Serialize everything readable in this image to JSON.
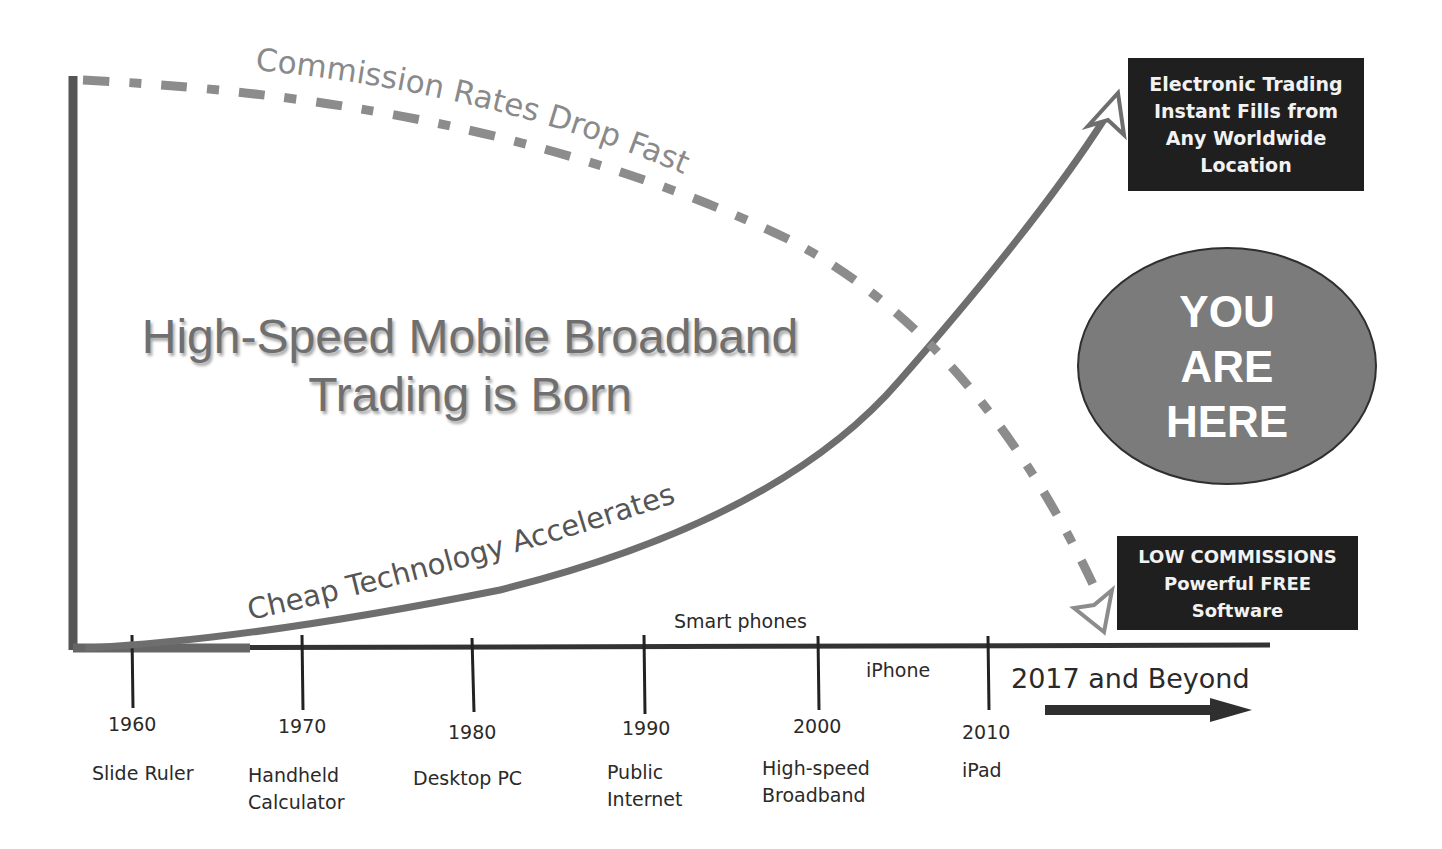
{
  "diagram": {
    "headline": [
      "High-Speed Mobile Broadband",
      "Trading is Born"
    ],
    "curves": {
      "commission": {
        "label": "Commission Rates Drop Fast",
        "style": "dashed",
        "direction": "falling",
        "color": "#8c8c8c"
      },
      "technology": {
        "label": "Cheap Technology Accelerates",
        "style": "solid",
        "direction": "rising",
        "color": "#6e6e6e"
      }
    },
    "callouts": {
      "top": [
        "Electronic Trading",
        "Instant Fills from",
        "Any Worldwide",
        "Location"
      ],
      "bottom": [
        "LOW COMMISSIONS",
        "Powerful FREE",
        "Software"
      ],
      "you_are_here": [
        "YOU",
        "ARE",
        "HERE"
      ]
    },
    "timeline": {
      "ticks": [
        {
          "year": "1960",
          "label": [
            "Slide Ruler"
          ]
        },
        {
          "year": "1970",
          "label": [
            "Handheld",
            "Calculator"
          ]
        },
        {
          "year": "1980",
          "label": [
            "Desktop PC"
          ]
        },
        {
          "year": "1990",
          "label": [
            "Public",
            "Internet"
          ]
        },
        {
          "year": "2000",
          "label": [
            "High-speed",
            "Broadband"
          ]
        },
        {
          "year": "2010",
          "label": [
            "iPad"
          ]
        }
      ],
      "annotations": {
        "smart_phones": "Smart phones",
        "iphone": "iPhone"
      },
      "future": "2017 and Beyond"
    }
  }
}
